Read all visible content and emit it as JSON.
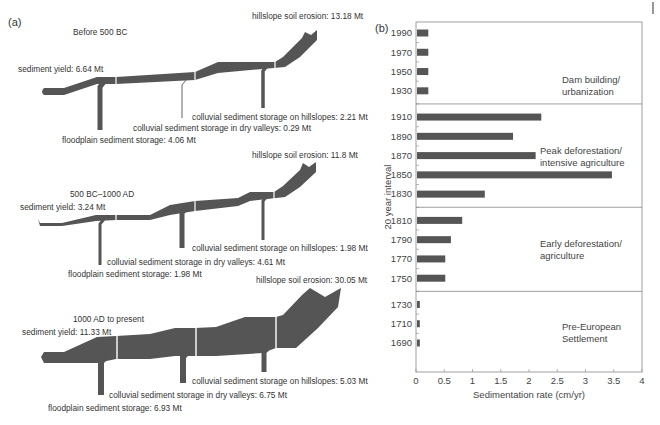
{
  "panel_a": {
    "label": "(a)",
    "diagrams": [
      {
        "period": "Before 500 BC",
        "sediment_yield": "sediment yield: 6.64 Mt",
        "hillslope_erosion": "hillslope soil erosion: 13.18 Mt",
        "hillslope_storage": "colluvial sediment storage on hillslopes: 2.21 Mt",
        "valley_storage": "colluvial sediment storage in dry valleys: 0.29 Mt",
        "floodplain_storage": "floodplain sediment storage: 4.06 Mt",
        "values_mt": {
          "yield": 6.64,
          "erosion": 13.18,
          "hillslopes": 2.21,
          "dry_valleys": 0.29,
          "floodplain": 4.06
        }
      },
      {
        "period": "500 BC–1000 AD",
        "sediment_yield": "sediment yield: 3.24 Mt",
        "hillslope_erosion": "hillslope soil erosion: 11.8 Mt",
        "hillslope_storage": "colluvial sediment storage on hillslopes: 1.98 Mt",
        "valley_storage": "colluvial sediment storage in dry valleys: 4.61 Mt",
        "floodplain_storage": "floodplain sediment storage: 1.98 Mt",
        "values_mt": {
          "yield": 3.24,
          "erosion": 11.8,
          "hillslopes": 1.98,
          "dry_valleys": 4.61,
          "floodplain": 1.98
        }
      },
      {
        "period": "1000 AD to present",
        "sediment_yield": "sediment yield: 11.33 Mt",
        "hillslope_erosion": "hillslope soil erosion: 30.05 Mt",
        "hillslope_storage": "colluvial sediment storage on hillslopes: 5.03 Mt",
        "valley_storage": "colluvial sediment storage in dry valleys: 6.75 Mt",
        "floodplain_storage": "floodplain sediment storage: 6.93 Mt",
        "values_mt": {
          "yield": 11.33,
          "erosion": 30.05,
          "hillslopes": 5.03,
          "dry_valleys": 6.75,
          "floodplain": 6.93
        }
      }
    ],
    "flow_color": "#555555"
  },
  "chart_data": {
    "type": "bar",
    "orientation": "horizontal",
    "panel_label": "(b)",
    "title": "",
    "xlabel": "Sedimentation rate (cm/yr)",
    "ylabel": "20 year interval",
    "xlim": [
      0,
      4
    ],
    "xticks": [
      "0",
      "0.5",
      "1",
      "1.5",
      "2",
      "2.5",
      "3",
      "3.5",
      "4"
    ],
    "categories": [
      "1990",
      "1970",
      "1950",
      "1930",
      "1910",
      "1890",
      "1870",
      "1850",
      "1830",
      "1810",
      "1790",
      "1770",
      "1750",
      "1730",
      "1710",
      "1690"
    ],
    "values": [
      0.2,
      0.2,
      0.2,
      0.2,
      2.2,
      1.7,
      2.1,
      3.45,
      1.2,
      0.8,
      0.6,
      0.5,
      0.5,
      0.05,
      0.05,
      0.05
    ],
    "bar_color": "#555555",
    "grid": false,
    "eras": [
      {
        "label_lines": [
          "Dam building/",
          "urbanization"
        ],
        "categories": [
          "1990",
          "1970",
          "1950",
          "1930"
        ]
      },
      {
        "label_lines": [
          "Peak deforestation/",
          "intensive agriculture"
        ],
        "categories": [
          "1910",
          "1890",
          "1870",
          "1850",
          "1830"
        ]
      },
      {
        "label_lines": [
          "Early deforestation/",
          "agriculture"
        ],
        "categories": [
          "1810",
          "1790",
          "1770",
          "1750"
        ]
      },
      {
        "label_lines": [
          "Pre-European",
          "Settlement"
        ],
        "categories": [
          "1730",
          "1710",
          "1690"
        ]
      }
    ]
  }
}
